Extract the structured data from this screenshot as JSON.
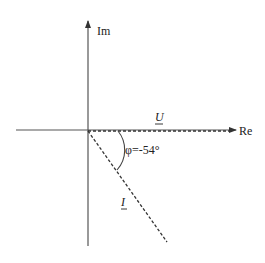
{
  "diagram": {
    "type": "phasor-diagram",
    "axes": {
      "real_label": "Re",
      "imag_label": "Im"
    },
    "phasors": [
      {
        "name": "voltage",
        "label": "U",
        "underlined": true,
        "angle_deg": 0,
        "style": "dashed"
      },
      {
        "name": "current",
        "label": "I",
        "underlined": true,
        "angle_deg": -54,
        "style": "dashed"
      }
    ],
    "angle_annotation": {
      "label": "φ=-54°",
      "value_deg": -54
    },
    "colors": {
      "line": "#333333",
      "text": "#222222",
      "background": "#ffffff"
    }
  }
}
